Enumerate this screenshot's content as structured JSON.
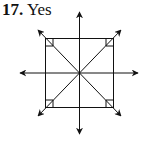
{
  "problem": {
    "number": "17.",
    "answer": "Yes"
  },
  "figure": {
    "shape": "square",
    "lines_of_symmetry": 4,
    "stroke_color": "#111111"
  }
}
